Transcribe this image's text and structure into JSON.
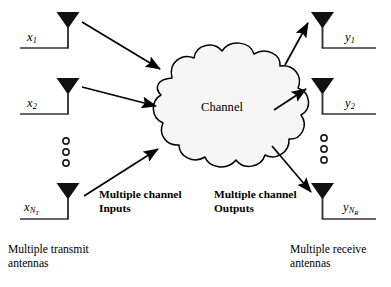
{
  "figure": {
    "background_color": "#ffffff",
    "line_color": "#000000",
    "cloud_fill": "#f6f6f6"
  },
  "channel": {
    "label": "Channel",
    "shape": "cloud"
  },
  "transmit": {
    "caption_line1": "Multiple transmit",
    "caption_line2": "antennas",
    "annotation_line1": "Multiple channel",
    "annotation_line2": "Inputs",
    "ellipsis_symbol": "○",
    "ellipsis_count": 3,
    "antennas": [
      {
        "var": "x",
        "sub": "1",
        "subsub": ""
      },
      {
        "var": "x",
        "sub": "2",
        "subsub": ""
      },
      {
        "var": "x",
        "sub": "N",
        "subsub": "T"
      }
    ]
  },
  "receive": {
    "caption_line1": "Multiple receive",
    "caption_line2": "antennas",
    "annotation_line1": "Multiple channel",
    "annotation_line2": "Outputs",
    "ellipsis_symbol": "○",
    "ellipsis_count": 3,
    "antennas": [
      {
        "var": "y",
        "sub": "1",
        "subsub": ""
      },
      {
        "var": "y",
        "sub": "2",
        "subsub": ""
      },
      {
        "var": "y",
        "sub": "N",
        "subsub": "R"
      }
    ]
  },
  "arrows": {
    "input_count": 3,
    "output_count": 3,
    "direction_inputs": "left-to-right into channel",
    "direction_outputs": "channel to right antennas"
  }
}
